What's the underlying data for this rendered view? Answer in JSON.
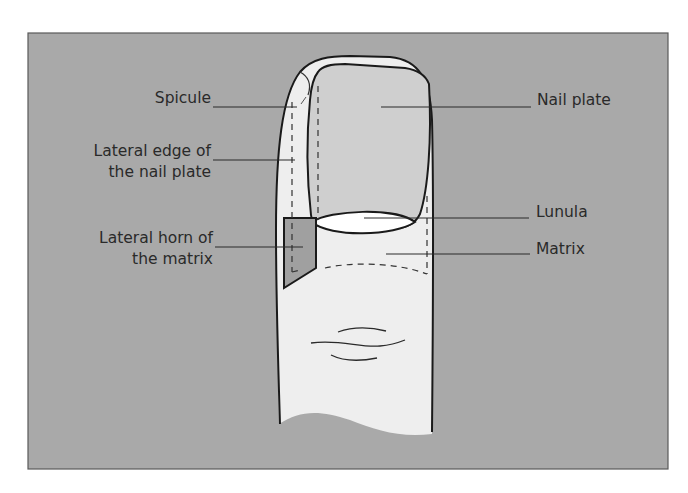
{
  "figure": {
    "background_color": "#a9a9a9",
    "finger_color": "#eeeeee",
    "nail_plate_color": "#cfcfcf",
    "lunula_color": "#ffffff",
    "horn_color": "#a0a0a0",
    "line_color": "#222222"
  },
  "labels": {
    "spicule": "Spicule",
    "lateral_edge_line1": "Lateral edge of",
    "lateral_edge_line2": "the nail plate",
    "lateral_horn_line1": "Lateral horn of",
    "lateral_horn_line2": "the matrix",
    "nail_plate": "Nail plate",
    "lunula": "Lunula",
    "matrix": "Matrix"
  }
}
